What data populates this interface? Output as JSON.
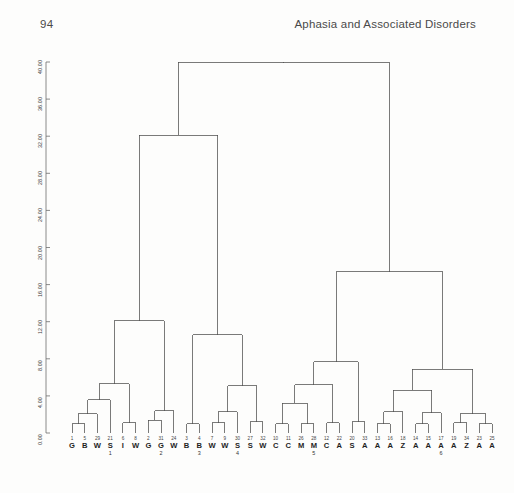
{
  "page": {
    "folio": "94",
    "running_title": "Aphasia and Associated Disorders"
  },
  "chart_data": {
    "type": "dendrogram",
    "title": "",
    "xlabel": "",
    "ylabel": "",
    "ylim": [
      0.0,
      40.0
    ],
    "grid": false,
    "legend": "none",
    "axis": {
      "ticks": [
        "0.00",
        "4.00",
        "8.00",
        "12.00",
        "16.00",
        "20.00",
        "24.00",
        "28.00",
        "32.00",
        "36.00",
        "40.00"
      ],
      "tick_values": [
        0,
        4,
        8,
        12,
        16,
        20,
        24,
        28,
        32,
        36,
        40
      ],
      "orientation": "vertical-rotated"
    },
    "leaves": [
      {
        "num": "1",
        "code": "G",
        "sub": ""
      },
      {
        "num": "5",
        "code": "B",
        "sub": ""
      },
      {
        "num": "29",
        "code": "W",
        "sub": ""
      },
      {
        "num": "21",
        "code": "S",
        "sub": "1"
      },
      {
        "num": "6",
        "code": "I",
        "sub": ""
      },
      {
        "num": "8",
        "code": "W",
        "sub": ""
      },
      {
        "num": "2",
        "code": "G",
        "sub": ""
      },
      {
        "num": "31",
        "code": "G",
        "sub": "2"
      },
      {
        "num": "24",
        "code": "W",
        "sub": ""
      },
      {
        "num": "3",
        "code": "B",
        "sub": ""
      },
      {
        "num": "4",
        "code": "B",
        "sub": "3"
      },
      {
        "num": "7",
        "code": "W",
        "sub": ""
      },
      {
        "num": "9",
        "code": "W",
        "sub": ""
      },
      {
        "num": "30",
        "code": "S",
        "sub": "4"
      },
      {
        "num": "27",
        "code": "S",
        "sub": ""
      },
      {
        "num": "32",
        "code": "W",
        "sub": ""
      },
      {
        "num": "10",
        "code": "C",
        "sub": ""
      },
      {
        "num": "11",
        "code": "C",
        "sub": ""
      },
      {
        "num": "26",
        "code": "M",
        "sub": ""
      },
      {
        "num": "28",
        "code": "M",
        "sub": "5"
      },
      {
        "num": "12",
        "code": "C",
        "sub": ""
      },
      {
        "num": "22",
        "code": "A",
        "sub": ""
      },
      {
        "num": "20",
        "code": "S",
        "sub": ""
      },
      {
        "num": "33",
        "code": "A",
        "sub": ""
      },
      {
        "num": "13",
        "code": "A",
        "sub": ""
      },
      {
        "num": "16",
        "code": "A",
        "sub": ""
      },
      {
        "num": "18",
        "code": "Z",
        "sub": ""
      },
      {
        "num": "14",
        "code": "A",
        "sub": ""
      },
      {
        "num": "15",
        "code": "A",
        "sub": ""
      },
      {
        "num": "17",
        "code": "A",
        "sub": "6"
      },
      {
        "num": "19",
        "code": "A",
        "sub": ""
      },
      {
        "num": "34",
        "code": "Z",
        "sub": ""
      },
      {
        "num": "23",
        "code": "A",
        "sub": ""
      },
      {
        "num": "25",
        "code": "A",
        "sub": ""
      }
    ],
    "merges": [
      {
        "left": "leaf:0",
        "right": "leaf:1",
        "height": 1.0
      },
      {
        "left": "m:0",
        "right": "leaf:2",
        "height": 2.1
      },
      {
        "left": "m:1",
        "right": "leaf:3",
        "height": 3.6
      },
      {
        "left": "leaf:4",
        "right": "leaf:5",
        "height": 1.1
      },
      {
        "left": "m:3",
        "right": "m:2",
        "height": 5.3
      },
      {
        "left": "leaf:6",
        "right": "leaf:7",
        "height": 1.4
      },
      {
        "left": "m:5",
        "right": "leaf:8",
        "height": 2.4
      },
      {
        "left": "m:4",
        "right": "m:6",
        "height": 12.1
      },
      {
        "left": "leaf:9",
        "right": "leaf:10",
        "height": 1.0
      },
      {
        "left": "leaf:11",
        "right": "leaf:12",
        "height": 1.1
      },
      {
        "left": "m:9",
        "right": "leaf:13",
        "height": 2.3
      },
      {
        "left": "leaf:14",
        "right": "leaf:15",
        "height": 1.2
      },
      {
        "left": "m:10",
        "right": "m:11",
        "height": 5.1
      },
      {
        "left": "m:8",
        "right": "m:12",
        "height": 10.6
      },
      {
        "left": "m:7",
        "right": "m:13",
        "height": 32.1
      },
      {
        "left": "leaf:16",
        "right": "leaf:17",
        "height": 1.0
      },
      {
        "left": "leaf:18",
        "right": "leaf:19",
        "height": 1.0
      },
      {
        "left": "m:15",
        "right": "m:16",
        "height": 3.2
      },
      {
        "left": "leaf:20",
        "right": "leaf:21",
        "height": 1.1
      },
      {
        "left": "m:17",
        "right": "m:18",
        "height": 5.2
      },
      {
        "left": "leaf:22",
        "right": "leaf:23",
        "height": 1.2
      },
      {
        "left": "m:19",
        "right": "m:20",
        "height": 7.7
      },
      {
        "left": "leaf:24",
        "right": "leaf:25",
        "height": 1.0
      },
      {
        "left": "m:22",
        "right": "leaf:26",
        "height": 2.3
      },
      {
        "left": "leaf:27",
        "right": "leaf:28",
        "height": 1.0
      },
      {
        "left": "m:24",
        "right": "leaf:29",
        "height": 2.2
      },
      {
        "left": "m:23",
        "right": "m:25",
        "height": 4.6
      },
      {
        "left": "leaf:30",
        "right": "leaf:31",
        "height": 1.1
      },
      {
        "left": "leaf:32",
        "right": "leaf:33",
        "height": 1.0
      },
      {
        "left": "m:27",
        "right": "m:28",
        "height": 2.1
      },
      {
        "left": "m:26",
        "right": "m:29",
        "height": 6.9
      },
      {
        "left": "m:21",
        "right": "m:30",
        "height": 17.4
      },
      {
        "left": "m:14",
        "right": "m:31",
        "height": 40.0
      }
    ]
  }
}
